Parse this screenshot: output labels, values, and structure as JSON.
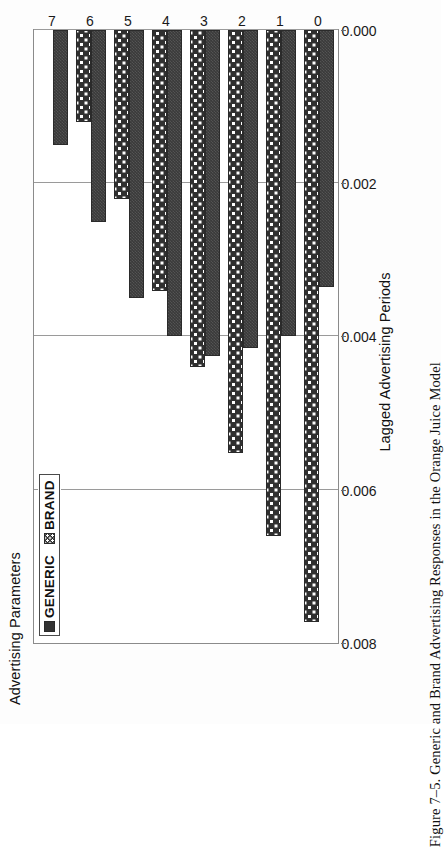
{
  "figure": {
    "caption": "Figure 7–5.  Generic and Brand Advertising Responses in the Orange Juice Model"
  },
  "chart_data": {
    "type": "bar",
    "orientation": "horizontal-rotated",
    "title": "",
    "xlabel": "Lagged Advertising Periods",
    "ylabel": "Advertising Parameters",
    "categories": [
      "0",
      "1",
      "2",
      "3",
      "4",
      "5",
      "6",
      "7"
    ],
    "ytick_labels": [
      "0.008",
      "0.006",
      "0.004",
      "0.002",
      "0.000"
    ],
    "ytick_values": [
      0.008,
      0.006,
      0.004,
      0.002,
      0.0
    ],
    "ylim": [
      0.0,
      0.008
    ],
    "grid": true,
    "legend_position": "top-left",
    "series": [
      {
        "name": "GENERIC",
        "pattern": "solid-dark",
        "color": "#333333",
        "values": [
          0.00335,
          0.004,
          0.00415,
          0.00425,
          0.004,
          0.0035,
          0.0025,
          0.0015
        ]
      },
      {
        "name": "BRAND",
        "pattern": "checkered",
        "color": "#303030",
        "values": [
          0.00772,
          0.0066,
          0.00552,
          0.0044,
          0.0034,
          0.0022,
          0.0012,
          0.0
        ]
      }
    ]
  },
  "legend": {
    "entries": [
      {
        "label": "GENERIC",
        "swatch": "solid-dark-swatch"
      },
      {
        "label": "BRAND",
        "swatch": "checkered-swatch"
      }
    ]
  }
}
